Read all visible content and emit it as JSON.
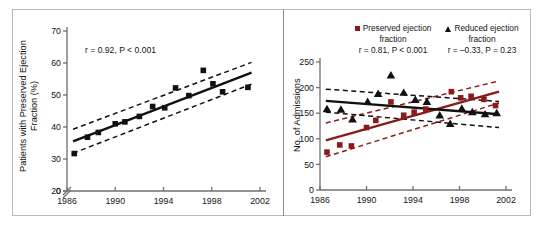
{
  "figure": {
    "background": "#ffffff",
    "frame_color": "#b9b9b9",
    "colors": {
      "preserved_ef": "#8B1A1A",
      "reduced_ef": "#111111",
      "axis": "#6f6f6f",
      "text": "#141414"
    }
  },
  "panels": [
    {
      "id": "left",
      "ylabel": "Patients with Preserved Ejection Fraction (%)",
      "annotation": "r = 0.92, P < 0.001",
      "xticks": [
        "1986",
        "1990",
        "1994",
        "1998",
        "2002"
      ],
      "yticks": [
        "0",
        "20",
        "30",
        "40",
        "50",
        "60",
        "70"
      ],
      "axis_break": true
    },
    {
      "id": "right",
      "ylabel": "No. of Admissions",
      "xticks": [
        "1986",
        "1990",
        "1994",
        "1998",
        "2002"
      ],
      "yticks": [
        "0",
        "50",
        "100",
        "150",
        "200",
        "250"
      ],
      "legend": [
        {
          "marker": "square",
          "color": "#8B1A1A",
          "label_line1": "Preserved ejection",
          "label_line2": "fraction",
          "annotation": "r = 0.81, P < 0.001"
        },
        {
          "marker": "triangle",
          "color": "#111111",
          "label_line1": "Reduced ejection",
          "label_line2": "fraction",
          "annotation": "r = –0.33, P = 0.23"
        }
      ]
    }
  ],
  "chart_data": [
    {
      "type": "scatter",
      "id": "left-panel",
      "title": "",
      "xlabel": "",
      "ylabel": "Patients with Preserved Ejection Fraction (%)",
      "xlim": [
        1986,
        2002
      ],
      "ylim": [
        20,
        70
      ],
      "y_axis_break_below": 20,
      "xticks": [
        1986,
        1990,
        1994,
        1998,
        2002
      ],
      "yticks": [
        20,
        30,
        40,
        50,
        60,
        70
      ],
      "grid": false,
      "legend_position": "none",
      "annotations": [
        {
          "text": "r = 0.92, P < 0.001",
          "x": 1988.2,
          "y": 65
        }
      ],
      "series": [
        {
          "name": "Preserved ejection fraction (%)",
          "marker": "square",
          "color": "#111111",
          "points": [
            {
              "x": 1986.6,
              "y": 31.7
            },
            {
              "x": 1987.7,
              "y": 36.8
            },
            {
              "x": 1988.6,
              "y": 38.3
            },
            {
              "x": 1990.0,
              "y": 41.0
            },
            {
              "x": 1990.8,
              "y": 41.6
            },
            {
              "x": 1992.0,
              "y": 43.3
            },
            {
              "x": 1993.1,
              "y": 46.4
            },
            {
              "x": 1994.1,
              "y": 46.0
            },
            {
              "x": 1995.0,
              "y": 52.2
            },
            {
              "x": 1996.1,
              "y": 49.8
            },
            {
              "x": 1997.3,
              "y": 57.7
            },
            {
              "x": 1998.1,
              "y": 53.5
            },
            {
              "x": 1998.9,
              "y": 51.0
            },
            {
              "x": 2001.0,
              "y": 52.4
            }
          ]
        }
      ],
      "fit_line": {
        "name": "linear regression",
        "color": "#111111",
        "style": "solid",
        "x": [
          1986.5,
          2001.3
        ],
        "y": [
          35.5,
          57.0
        ]
      },
      "confidence_bands": {
        "style": "dashed",
        "color": "#111111",
        "upper": {
          "x": [
            1986.5,
            2001.3
          ],
          "y": [
            39.3,
            60.2
          ]
        },
        "lower": {
          "x": [
            1986.5,
            2001.3
          ],
          "y": [
            31.8,
            53.4
          ]
        }
      }
    },
    {
      "type": "scatter",
      "id": "right-panel",
      "title": "",
      "xlabel": "",
      "ylabel": "No. of Admissions",
      "xlim": [
        1986,
        2002
      ],
      "ylim": [
        0,
        250
      ],
      "xticks": [
        1986,
        1990,
        1994,
        1998,
        2002
      ],
      "yticks": [
        0,
        50,
        100,
        150,
        200,
        250
      ],
      "grid": false,
      "legend_position": "top",
      "annotations": [
        {
          "text": "r = 0.81, P < 0.001",
          "series": "Preserved ejection fraction"
        },
        {
          "text": "r = –0.33, P = 0.23",
          "series": "Reduced ejection fraction"
        }
      ],
      "series": [
        {
          "name": "Preserved ejection fraction",
          "marker": "square",
          "color": "#8B1A1A",
          "points": [
            {
              "x": 1986.6,
              "y": 74
            },
            {
              "x": 1987.7,
              "y": 88
            },
            {
              "x": 1988.7,
              "y": 86
            },
            {
              "x": 1990.0,
              "y": 122
            },
            {
              "x": 1990.8,
              "y": 136
            },
            {
              "x": 1992.1,
              "y": 172
            },
            {
              "x": 1993.2,
              "y": 146
            },
            {
              "x": 1994.1,
              "y": 152
            },
            {
              "x": 1995.1,
              "y": 158
            },
            {
              "x": 1997.3,
              "y": 192
            },
            {
              "x": 1998.1,
              "y": 180
            },
            {
              "x": 1999.0,
              "y": 183
            },
            {
              "x": 2000.1,
              "y": 177
            },
            {
              "x": 2001.1,
              "y": 165
            }
          ]
        },
        {
          "name": "Reduced ejection fraction",
          "marker": "triangle",
          "color": "#111111",
          "points": [
            {
              "x": 1986.6,
              "y": 158
            },
            {
              "x": 1987.8,
              "y": 157
            },
            {
              "x": 1988.8,
              "y": 138
            },
            {
              "x": 1990.1,
              "y": 172
            },
            {
              "x": 1991.0,
              "y": 188
            },
            {
              "x": 1992.1,
              "y": 224
            },
            {
              "x": 1993.2,
              "y": 190
            },
            {
              "x": 1994.2,
              "y": 176
            },
            {
              "x": 1995.2,
              "y": 172
            },
            {
              "x": 1996.3,
              "y": 146
            },
            {
              "x": 1997.2,
              "y": 129
            },
            {
              "x": 1998.2,
              "y": 159
            },
            {
              "x": 1999.1,
              "y": 152
            },
            {
              "x": 2000.2,
              "y": 148
            },
            {
              "x": 2001.2,
              "y": 150
            }
          ]
        }
      ],
      "fit_lines": [
        {
          "series": "Preserved ejection fraction",
          "color": "#8B1A1A",
          "style": "solid",
          "x": [
            1986.5,
            2001.4
          ],
          "y": [
            97,
            192
          ]
        },
        {
          "series": "Reduced ejection fraction",
          "color": "#111111",
          "style": "solid",
          "x": [
            1986.5,
            2001.4
          ],
          "y": [
            174,
            148
          ]
        }
      ],
      "confidence_bands": [
        {
          "series": "Preserved ejection fraction",
          "color": "#8B1A1A",
          "style": "dashed",
          "upper": {
            "x": [
              1986.5,
              2001.4
            ],
            "y": [
              131,
              213
            ]
          },
          "lower": {
            "x": [
              1986.5,
              2001.4
            ],
            "y": [
              65,
              170
            ]
          }
        },
        {
          "series": "Reduced ejection fraction",
          "color": "#111111",
          "style": "dashed",
          "upper": {
            "x": [
              1986.5,
              2001.4
            ],
            "y": [
              197,
              173
            ]
          },
          "lower": {
            "x": [
              1986.5,
              2001.4
            ],
            "y": [
              152,
              122
            ]
          }
        }
      ]
    }
  ]
}
